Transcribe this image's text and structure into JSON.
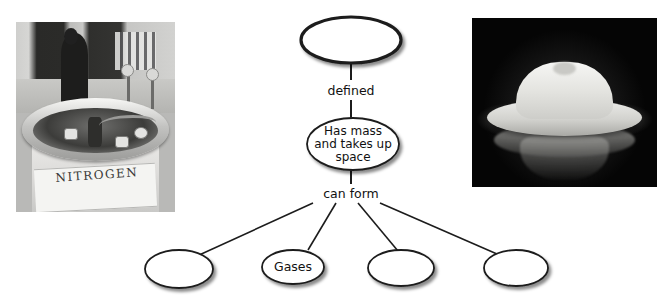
{
  "diagram": {
    "nodes": [
      {
        "id": "top",
        "label": "",
        "shape": "ellipse"
      },
      {
        "id": "middle",
        "label": "Has mass\nand takes up\nspace",
        "shape": "ellipse"
      },
      {
        "id": "leaf1",
        "label": "",
        "shape": "ellipse"
      },
      {
        "id": "leaf2",
        "label": "Gases",
        "shape": "ellipse"
      },
      {
        "id": "leaf3",
        "label": "",
        "shape": "ellipse"
      },
      {
        "id": "leaf4",
        "label": "",
        "shape": "ellipse"
      }
    ],
    "node_text": {
      "top": "",
      "middle_line1": "Has mass",
      "middle_line2": "and takes up",
      "middle_line3": "space",
      "leaf1": "",
      "leaf2": "Gases",
      "leaf3": "",
      "leaf4": ""
    },
    "link_labels": {
      "defined": "defined",
      "can_form": "can form"
    },
    "colors": {
      "stroke": "#1c1c1c",
      "text": "#111111",
      "background": "#ffffff"
    }
  },
  "photos": {
    "left": {
      "name": "liquid-nitrogen-tank-photo",
      "label_text": "NITROGEN",
      "description": "Grayscale photo of a liquid nitrogen dewar in a laboratory"
    },
    "right": {
      "name": "white-hat-photo",
      "description": "White hat on a black reflective surface"
    }
  }
}
